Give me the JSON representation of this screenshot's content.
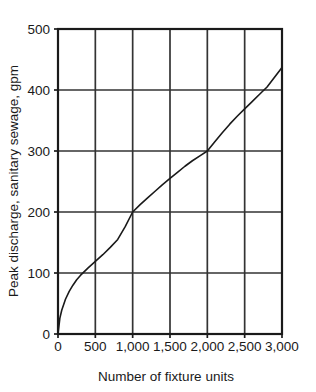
{
  "chart_data": {
    "type": "line",
    "title": "",
    "subtitle": "",
    "xlabel": "Number of fixture units",
    "ylabel": "Peak discharge, sanitary sewage, gpm",
    "xlim": [
      0,
      3000
    ],
    "ylim": [
      0,
      500
    ],
    "xticks": [
      0,
      500,
      1000,
      1500,
      2000,
      2500,
      3000
    ],
    "xtick_labels": [
      "0",
      "500",
      "1,000",
      "1,500",
      "2,000",
      "2,500",
      "3,000"
    ],
    "yticks": [
      0,
      100,
      200,
      300,
      400,
      500
    ],
    "ytick_labels": [
      "0",
      "100",
      "200",
      "300",
      "400",
      "500"
    ],
    "grid": true,
    "grid_color": "#333333",
    "legend": null,
    "legend_position": "none",
    "line_color": "#1a1a1a",
    "line_width": 1.6,
    "series": [
      {
        "name": "Peak discharge",
        "x": [
          0,
          25,
          50,
          100,
          150,
          200,
          250,
          300,
          400,
          500,
          600,
          700,
          800,
          900,
          1000,
          1100,
          1200,
          1300,
          1400,
          1500,
          1600,
          1700,
          1800,
          1900,
          2000,
          2100,
          2200,
          2300,
          2400,
          2500,
          2600,
          2700,
          2800,
          2900,
          3000
        ],
        "y": [
          0,
          26,
          39,
          57,
          70,
          80,
          89,
          96,
          108,
          119,
          130,
          142,
          155,
          176,
          200,
          212,
          223,
          234,
          245,
          255,
          265,
          275,
          284,
          292,
          300,
          315,
          330,
          344,
          357,
          369,
          381,
          393,
          405,
          421,
          437
        ]
      }
    ]
  },
  "figure": {
    "background_color": "#ffffff",
    "axis_color": "#1a1a1a"
  }
}
